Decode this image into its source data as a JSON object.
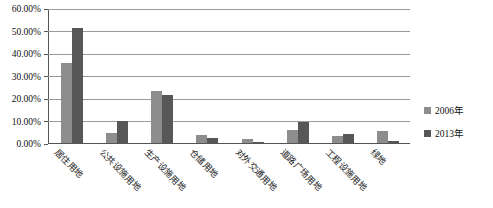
{
  "chart_data": {
    "type": "bar",
    "title": "",
    "xlabel": "",
    "ylabel": "",
    "ylim": [
      0,
      60
    ],
    "grid": true,
    "legend_position": "right",
    "categories": [
      "居住用地",
      "公共设施用地",
      "生产设施用地",
      "仓储用地",
      "对外交通用地",
      "道路广场用地",
      "工程设施用地",
      "绿地"
    ],
    "ytick_labels": [
      "0.00%",
      "10.00%",
      "20.00%",
      "30.00%",
      "40.00%",
      "50.00%",
      "60.00%"
    ],
    "ytick_values": [
      0,
      10,
      20,
      30,
      40,
      50,
      60
    ],
    "series": [
      {
        "name": "2006年",
        "color": "#8d8d8d",
        "values": [
          35.5,
          4.3,
          23.0,
          3.5,
          1.7,
          5.9,
          3.0,
          5.2
        ]
      },
      {
        "name": "2013年",
        "color": "#575757",
        "values": [
          51.0,
          10.0,
          21.2,
          2.3,
          0.4,
          9.2,
          4.0,
          0.8
        ]
      }
    ]
  },
  "legend": {
    "items": [
      {
        "label": "2006年",
        "color": "#8d8d8d"
      },
      {
        "label": "2013年",
        "color": "#575757"
      }
    ]
  },
  "colors": {
    "series_2006": "#8d8d8d",
    "series_2013": "#575757",
    "gridline": "#9a9a9a",
    "axis": "#555555",
    "background": "#ffffff"
  }
}
